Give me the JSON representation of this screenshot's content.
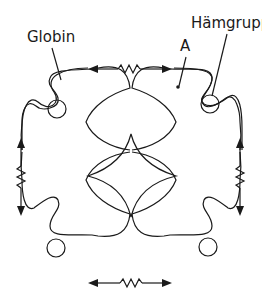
{
  "labels": {
    "globin": "Globin",
    "haemgroup": "Hämgruppe",
    "subunit": "A"
  },
  "diagram": {
    "subunit_count": 4,
    "haem_groups": 4,
    "spring_links": 4,
    "spring_positions": [
      "top",
      "bottom",
      "left",
      "right"
    ],
    "center_shape": "four-pointed astroid",
    "line_color": "#1a1a1a",
    "background": "#ffffff"
  }
}
